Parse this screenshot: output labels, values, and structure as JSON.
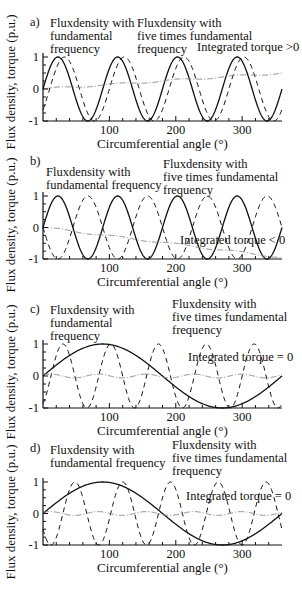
{
  "y_axis_title": "Flux density, torque (p.u.)",
  "chart_data": [
    {
      "type": "line",
      "panel": "a)",
      "xlabel": "Circumferential angle (°)",
      "ylabel": "Flux density, torque (p.u.)",
      "xlim": [
        0,
        360
      ],
      "ylim": [
        -1,
        1
      ],
      "xticks": [
        100,
        200,
        300
      ],
      "yticks": [
        -1,
        0,
        1
      ],
      "grid": false,
      "series": [
        {
          "name": "Fluxdensity with fundamental frequency",
          "style": "solid",
          "cycles": 4,
          "phase_deg": 0
        },
        {
          "name": "Fluxdensity with five times fundamental frequency",
          "style": "dashed",
          "cycles": 4,
          "phase_deg": -40
        },
        {
          "name": "Integrated torque",
          "style": "dashdot",
          "start": 0,
          "end": 0.5
        }
      ],
      "annotations": [
        {
          "text": [
            "Fluxdensity with",
            "fundamental",
            "frequency"
          ],
          "x": 50,
          "y": 27
        },
        {
          "text": [
            "Fluxdensity with",
            "five times fundamental",
            "frequency"
          ],
          "x": 137,
          "y": 27
        },
        {
          "text": [
            "Integrated torque >0"
          ],
          "x": 197,
          "y": 51
        }
      ]
    },
    {
      "type": "line",
      "panel": "b)",
      "xlabel": "Circumferential angle (°)",
      "ylabel": "Flux density, torque (p.u.)",
      "xlim": [
        0,
        360
      ],
      "ylim": [
        -1,
        1
      ],
      "xticks": [
        100,
        200,
        300
      ],
      "yticks": [
        -1,
        0,
        1
      ],
      "grid": false,
      "series": [
        {
          "name": "Fluxdensity with fundamental frequency",
          "style": "solid",
          "cycles": 4,
          "phase_deg": 0
        },
        {
          "name": "Fluxdensity with five times fundamental frequency",
          "style": "dashed",
          "cycles": 4,
          "phase_deg": 180
        },
        {
          "name": "Integrated torque",
          "style": "dashdot",
          "start": 0,
          "end": -0.95
        }
      ],
      "annotations": [
        {
          "text": [
            "Fluxdensity with",
            "fundamental frequency"
          ],
          "x": 46,
          "y": 176
        },
        {
          "text": [
            "Fluxdensity with",
            "five times fundamental",
            "frequency"
          ],
          "x": 163,
          "y": 168
        },
        {
          "text": [
            "Integrated torque < 0"
          ],
          "x": 180,
          "y": 244
        }
      ]
    },
    {
      "type": "line",
      "panel": "c)",
      "xlabel": "Circumferential angle (°)",
      "ylabel": "Flux density, torque (p.u.)",
      "xlim": [
        0,
        360
      ],
      "ylim": [
        -1,
        1
      ],
      "xticks": [
        100,
        200,
        300
      ],
      "yticks": [
        -1,
        0,
        1
      ],
      "grid": false,
      "series": [
        {
          "name": "Fluxdensity with fundamental frequency",
          "style": "solid",
          "cycles": 1,
          "phase_deg": 0
        },
        {
          "name": "Fluxdensity with five times fundamental frequency",
          "style": "dashed",
          "cycles": 5,
          "phase_deg": -60
        },
        {
          "name": "Integrated torque",
          "style": "dashdot",
          "start": 0,
          "end": 0,
          "ripple": 0.06
        }
      ],
      "annotations": [
        {
          "text": [
            "Fluxdensity with",
            "fundamental",
            "frequency"
          ],
          "x": 50,
          "y": 314
        },
        {
          "text": [
            "Fluxdensity with",
            "five times fundamental",
            "frequency"
          ],
          "x": 172,
          "y": 308
        },
        {
          "text": [
            "Integrated torque = 0"
          ],
          "x": 188,
          "y": 361
        }
      ]
    },
    {
      "type": "line",
      "panel": "d)",
      "xlabel": "Circumferential angle (°)",
      "ylabel": "Flux density, torque (p.u.)",
      "xlim": [
        0,
        360
      ],
      "ylim": [
        -1,
        1
      ],
      "xticks": [
        100,
        200,
        300
      ],
      "yticks": [
        -1,
        0,
        1
      ],
      "grid": false,
      "series": [
        {
          "name": "Fluxdensity with fundamental frequency",
          "style": "solid",
          "cycles": 1,
          "phase_deg": 0
        },
        {
          "name": "Fluxdensity with five times fundamental frequency",
          "style": "dashed",
          "cycles": 5,
          "phase_deg": 210
        },
        {
          "name": "Integrated torque",
          "style": "dashdot",
          "start": 0,
          "end": 0,
          "ripple": 0.06
        }
      ],
      "annotations": [
        {
          "text": [
            "Fluxdensity with",
            "fundamental frequency"
          ],
          "x": 50,
          "y": 454
        },
        {
          "text": [
            "Fluxdensity with",
            "five times fundamental",
            "frequency"
          ],
          "x": 172,
          "y": 449
        },
        {
          "text": [
            "Integrated torque = 0"
          ],
          "x": 186,
          "y": 500
        }
      ]
    }
  ]
}
